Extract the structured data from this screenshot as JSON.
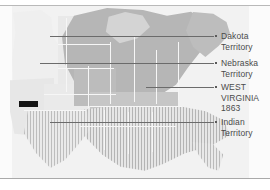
{
  "map": {
    "title_visible": false,
    "region_names": {
      "west_territories": "western territories",
      "union": "Union states",
      "confederacy": "Confederate states"
    },
    "colors": {
      "background": "#f3f3f3",
      "union_fill": "#b6b6b6",
      "territory_fill": "#e9e9e9",
      "confederate_hatch": "#b4b4b4",
      "marker_bar": "#141414",
      "leader_line": "#6b6b6b",
      "label_text": "#4a4a4a",
      "frame_rule": "#b9b9b9"
    }
  },
  "callouts": [
    {
      "label": "Dakota\nTerritory",
      "line_y": 30,
      "line_x1": 50,
      "line_x2": 214,
      "text_y": 30
    },
    {
      "label": "Nebraska\nTerritory",
      "line_y": 57,
      "line_x1": 40,
      "line_x2": 214,
      "text_y": 57
    },
    {
      "label": "WEST\nVIRGINIA\n1863",
      "line_y": 81,
      "line_x1": 146,
      "line_x2": 214,
      "text_y": 81
    },
    {
      "label": "Indian\nTerritory",
      "line_y": 116,
      "line_x1": 50,
      "line_x2": 214,
      "text_y": 116
    }
  ],
  "marker": {
    "name": "black-bar-marker",
    "x": 19,
    "y": 95,
    "width": 19,
    "height": 6
  }
}
